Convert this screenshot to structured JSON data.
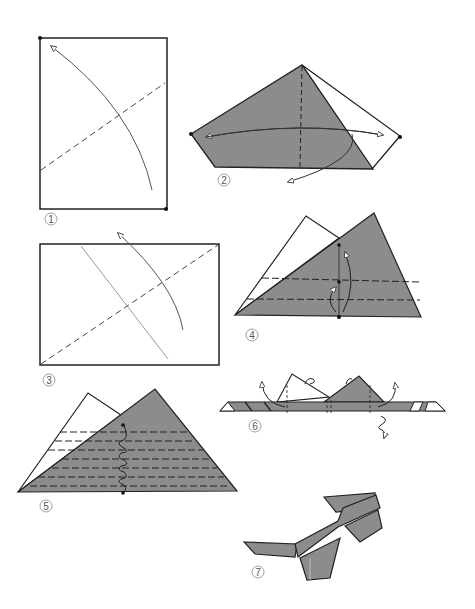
{
  "diagram": {
    "type": "origami-instructions",
    "colors": {
      "paper_colored": "#8c8c8c",
      "paper_white": "#ffffff",
      "line": "#1a1a1a",
      "arrow": "#555555",
      "label": "#777777"
    },
    "steps": [
      {
        "number": "1",
        "description": "Rectangle sheet with diagonal valley fold; arrow fold corner up"
      },
      {
        "number": "2",
        "description": "Folded kite shape, vertical valley crease, arrows flip"
      },
      {
        "number": "3",
        "description": "Rectangle with diagonal valley fold and crease line; arrow fold up"
      },
      {
        "number": "4",
        "description": "Triangle with two horizontal valley folds; fold bottom edge up"
      },
      {
        "number": "5",
        "description": "Triangle with repeated pleat folds (accordion)"
      },
      {
        "number": "6",
        "description": "Folded strip with two triangular lenses; fold ends back, turn over"
      },
      {
        "number": "7",
        "description": "Finished origami glasses"
      }
    ]
  }
}
